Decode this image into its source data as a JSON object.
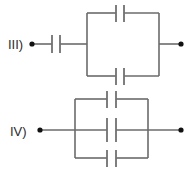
{
  "figure": {
    "type": "circuit-diagram",
    "background_color": "#ffffff",
    "wire_color": "#6b6b6b",
    "plate_color": "#707070",
    "terminal_color": "#111111",
    "label_color": "#2b2b2b",
    "wire_width": 1.6,
    "plate_width": 1.8,
    "terminal_radius": 2.6
  },
  "circuits": [
    {
      "id": "circuit-iii",
      "label": "III)",
      "label_x": 8,
      "label_y": 49,
      "left_terminal": {
        "cx": 32,
        "cy": 44
      },
      "right_terminal": {
        "cx": 181,
        "cy": 44
      },
      "series_capacitor": {
        "name": "series-capacitor",
        "plate_left_x": 52,
        "plate_right_x": 60,
        "plate_top_y": 35,
        "plate_bottom_y": 53
      },
      "parallel_box": {
        "left": 87,
        "right": 159,
        "top": 13,
        "bottom": 76
      },
      "branch_capacitors": [
        {
          "name": "top-branch-capacitor",
          "plate_left_x": 116,
          "plate_right_x": 124,
          "plate_top_y": 5,
          "plate_bottom_y": 22
        },
        {
          "name": "bottom-branch-capacitor",
          "plate_left_x": 116,
          "plate_right_x": 124,
          "plate_top_y": 68,
          "plate_bottom_y": 85
        }
      ],
      "wires": [
        {
          "name": "left-lead",
          "x1": 32,
          "y1": 44,
          "x2": 52,
          "y2": 44
        },
        {
          "name": "mid-lead",
          "x1": 60,
          "y1": 44,
          "x2": 87,
          "y2": 44
        },
        {
          "name": "right-lead",
          "x1": 159,
          "y1": 44,
          "x2": 181,
          "y2": 44
        },
        {
          "name": "box-left-rail",
          "x1": 87,
          "y1": 13,
          "x2": 87,
          "y2": 76
        },
        {
          "name": "box-right-rail",
          "x1": 159,
          "y1": 13,
          "x2": 159,
          "y2": 76
        },
        {
          "name": "top-branch-left-wire",
          "x1": 87,
          "y1": 13,
          "x2": 116,
          "y2": 13
        },
        {
          "name": "top-branch-right-wire",
          "x1": 124,
          "y1": 13,
          "x2": 159,
          "y2": 13
        },
        {
          "name": "bottom-branch-left-wire",
          "x1": 87,
          "y1": 76,
          "x2": 116,
          "y2": 76
        },
        {
          "name": "bottom-branch-right-wire",
          "x1": 124,
          "y1": 76,
          "x2": 159,
          "y2": 76
        }
      ]
    },
    {
      "id": "circuit-iv",
      "label": "IV)",
      "label_x": 10,
      "label_y": 136,
      "left_terminal": {
        "cx": 40,
        "cy": 130
      },
      "right_terminal": {
        "cx": 181,
        "cy": 130
      },
      "parallel_box": {
        "left": 75,
        "right": 148,
        "top": 99,
        "bottom": 158
      },
      "branch_capacitors": [
        {
          "name": "top-branch-capacitor",
          "plate_left_x": 107,
          "plate_right_x": 116,
          "plate_top_y": 91,
          "plate_bottom_y": 108
        },
        {
          "name": "middle-branch-capacitor",
          "plate_left_x": 107,
          "plate_right_x": 116,
          "plate_top_y": 118,
          "plate_bottom_y": 142
        },
        {
          "name": "bottom-branch-capacitor",
          "plate_left_x": 107,
          "plate_right_x": 116,
          "plate_top_y": 150,
          "plate_bottom_y": 167
        }
      ],
      "wires": [
        {
          "name": "left-lead",
          "x1": 40,
          "y1": 130,
          "x2": 107,
          "y2": 130
        },
        {
          "name": "right-lead",
          "x1": 116,
          "y1": 130,
          "x2": 181,
          "y2": 130
        },
        {
          "name": "box-left-rail",
          "x1": 75,
          "y1": 99,
          "x2": 75,
          "y2": 158
        },
        {
          "name": "box-right-rail",
          "x1": 148,
          "y1": 99,
          "x2": 148,
          "y2": 158
        },
        {
          "name": "top-branch-left-wire",
          "x1": 75,
          "y1": 99,
          "x2": 107,
          "y2": 99
        },
        {
          "name": "top-branch-right-wire",
          "x1": 116,
          "y1": 99,
          "x2": 148,
          "y2": 99
        },
        {
          "name": "bottom-branch-left-wire",
          "x1": 75,
          "y1": 158,
          "x2": 107,
          "y2": 158
        },
        {
          "name": "bottom-branch-right-wire",
          "x1": 116,
          "y1": 158,
          "x2": 148,
          "y2": 158
        }
      ]
    }
  ]
}
